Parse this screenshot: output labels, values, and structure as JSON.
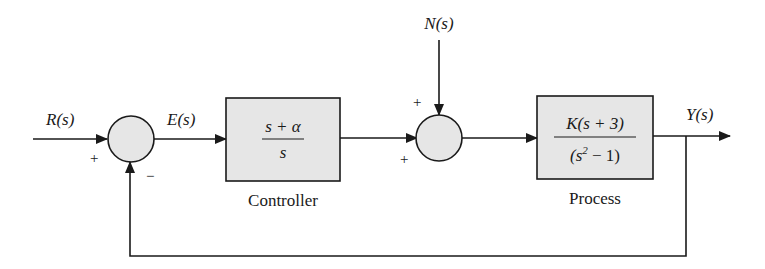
{
  "diagram": {
    "type": "feedback-control-block-diagram",
    "signals": {
      "input": "R(s)",
      "error": "E(s)",
      "disturbance": "N(s)",
      "output": "Y(s)"
    },
    "sum1": {
      "sign_input": "+",
      "sign_feedback": "−"
    },
    "sum2": {
      "sign_top": "+",
      "sign_left": "+"
    },
    "controller": {
      "numerator": "s + α",
      "denominator": "s",
      "caption": "Controller"
    },
    "process": {
      "numerator": "K(s + 3)",
      "denominator_prefix": "(s",
      "denominator_exp": "2",
      "denominator_suffix": " − 1)",
      "caption": "Process"
    },
    "colors": {
      "block_fill": "#e6e6e6",
      "stroke": "#1a1a1a",
      "background": "#ffffff"
    }
  }
}
